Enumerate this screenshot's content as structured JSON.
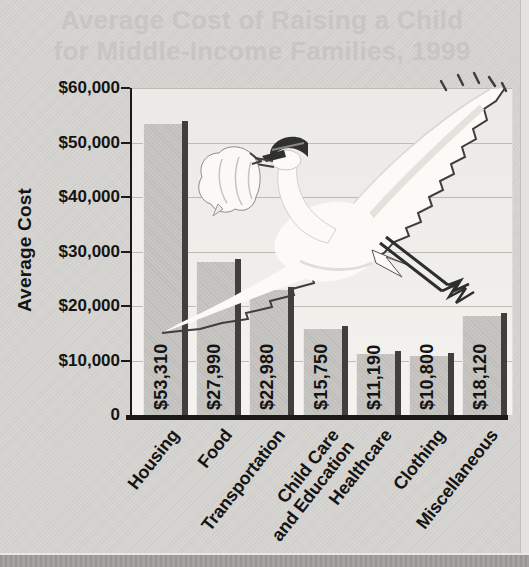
{
  "title": {
    "line1": "Average Cost of Raising a Child",
    "line2": "for Middle-Income Families, 1999"
  },
  "chart_data": {
    "type": "bar",
    "title": "Average Cost of Raising a Child for Middle-Income Families, 1999",
    "xlabel": "",
    "ylabel": "Average Cost",
    "ylim": [
      0,
      60000
    ],
    "grid": true,
    "legend": "none",
    "y_ticks": [
      {
        "value": 60000,
        "label": "$60,000"
      },
      {
        "value": 50000,
        "label": "$50,000"
      },
      {
        "value": 40000,
        "label": "$40,000"
      },
      {
        "value": 30000,
        "label": "$30,000"
      },
      {
        "value": 20000,
        "label": "$20,000"
      },
      {
        "value": 10000,
        "label": "$10,000"
      },
      {
        "value": 0,
        "label": "0"
      }
    ],
    "categories": [
      "Housing",
      "Food",
      "Transportation",
      "Child Care and Education",
      "Healthcare",
      "Clothing",
      "Miscellaneous"
    ],
    "category_label_lines": [
      [
        "Housing"
      ],
      [
        "Food"
      ],
      [
        "Transportation"
      ],
      [
        "Child Care",
        "and Education"
      ],
      [
        "Healthcare"
      ],
      [
        "Clothing"
      ],
      [
        "Miscellaneous"
      ]
    ],
    "values": [
      53310,
      27990,
      22980,
      15750,
      11190,
      10800,
      18120
    ],
    "value_labels": [
      "$53,310",
      "$27,990",
      "$22,980",
      "$15,750",
      "$11,190",
      "$10,800",
      "$18,120"
    ]
  },
  "illustration": {
    "name": "stork-carrying-baby-bundle"
  },
  "colors": {
    "page_bg": "#d6d4d0",
    "plot_bg": "#eeede9",
    "bar_fill": "#c7c6c3",
    "bar_shadow": "#413f3c",
    "gridline": "#ada8a2",
    "axis_ink": "#1a1a1a",
    "text_ink": "#141414",
    "title_gray": "#c7c6c4"
  }
}
